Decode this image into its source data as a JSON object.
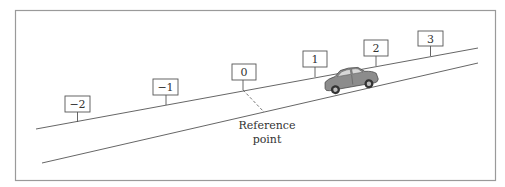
{
  "figure": {
    "frame_color": "#9a9a9a",
    "line_color": "#555555",
    "signs": [
      {
        "label": "−2",
        "value": -2
      },
      {
        "label": "−1",
        "value": -1
      },
      {
        "label": "0",
        "value": 0
      },
      {
        "label": "1",
        "value": 1
      },
      {
        "label": "2",
        "value": 2
      },
      {
        "label": "3",
        "value": 3
      }
    ],
    "reference": {
      "line1": "Reference",
      "line2": "point"
    },
    "car": {
      "color": "#8c8c8c"
    }
  }
}
